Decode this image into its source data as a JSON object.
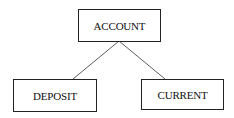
{
  "diagram": {
    "type": "hierarchy",
    "root": {
      "id": "account",
      "label": "ACCOUNT"
    },
    "children": [
      {
        "id": "deposit",
        "label": "DEPOSIT"
      },
      {
        "id": "current",
        "label": "CURRENT"
      }
    ],
    "edges": [
      {
        "from": "ACCOUNT",
        "to": "DEPOSIT"
      },
      {
        "from": "ACCOUNT",
        "to": "CURRENT"
      }
    ]
  }
}
